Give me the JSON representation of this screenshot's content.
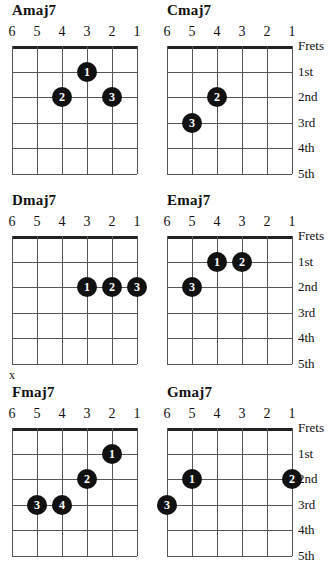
{
  "page": {
    "kind": "guitar-chord-chart",
    "width": 330,
    "height": 568,
    "dot_color": "#111111",
    "line_color": "#555555",
    "nut_color": "#222222",
    "text_color": "#111111"
  },
  "string_numbers": [
    "6",
    "5",
    "4",
    "3",
    "2",
    "1"
  ],
  "fret_labels": [
    "Frets",
    "1st",
    "2nd",
    "3rd",
    "4th",
    "5th"
  ],
  "markers": {
    "mute": "x"
  },
  "diagrams": [
    {
      "id": "amaj7",
      "title": "Amaj7",
      "col": 0,
      "row": 0,
      "show_fret_labels": false,
      "mute_marker": null,
      "dots": [
        {
          "label": "1",
          "string": 3,
          "fret": 1
        },
        {
          "label": "2",
          "string": 4,
          "fret": 2
        },
        {
          "label": "3",
          "string": 2,
          "fret": 2
        }
      ]
    },
    {
      "id": "cmaj7",
      "title": "Cmaj7",
      "col": 1,
      "row": 0,
      "show_fret_labels": true,
      "mute_marker": null,
      "dots": [
        {
          "label": "2",
          "string": 4,
          "fret": 2
        },
        {
          "label": "3",
          "string": 5,
          "fret": 3
        }
      ]
    },
    {
      "id": "dmaj7",
      "title": "Dmaj7",
      "col": 0,
      "row": 1,
      "show_fret_labels": false,
      "mute_marker": null,
      "dots": [
        {
          "label": "1",
          "string": 3,
          "fret": 2
        },
        {
          "label": "2",
          "string": 2,
          "fret": 2
        },
        {
          "label": "3",
          "string": 1,
          "fret": 2
        }
      ]
    },
    {
      "id": "emaj7",
      "title": "Emaj7",
      "col": 1,
      "row": 1,
      "show_fret_labels": true,
      "mute_marker": null,
      "dots": [
        {
          "label": "1",
          "string": 4,
          "fret": 1
        },
        {
          "label": "2",
          "string": 3,
          "fret": 1
        },
        {
          "label": "3",
          "string": 5,
          "fret": 2
        }
      ]
    },
    {
      "id": "fmaj7",
      "title": "Fmaj7",
      "col": 0,
      "row": 2,
      "show_fret_labels": false,
      "mute_marker": {
        "string": 6
      },
      "dots": [
        {
          "label": "1",
          "string": 2,
          "fret": 1
        },
        {
          "label": "2",
          "string": 3,
          "fret": 2
        },
        {
          "label": "3",
          "string": 5,
          "fret": 3
        },
        {
          "label": "4",
          "string": 4,
          "fret": 3
        }
      ]
    },
    {
      "id": "gmaj7",
      "title": "Gmaj7",
      "col": 1,
      "row": 2,
      "show_fret_labels": true,
      "mute_marker": null,
      "dots": [
        {
          "label": "1",
          "string": 5,
          "fret": 2
        },
        {
          "label": "2",
          "string": 1,
          "fret": 2
        },
        {
          "label": "3",
          "string": 6,
          "fret": 3
        }
      ]
    }
  ]
}
